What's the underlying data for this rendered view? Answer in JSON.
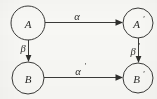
{
  "diagram": {
    "kind": "commutative-square",
    "background_color": "#f7f7f4",
    "stroke_color": "#3a3a38",
    "text_color": "#2b2b29",
    "nodes": [
      {
        "id": "top-left",
        "label": "A",
        "prime": "",
        "cx": 28,
        "cy": 23,
        "r": 17
      },
      {
        "id": "top-right",
        "label": "A",
        "prime": "'",
        "cx": 138,
        "cy": 23,
        "r": 15
      },
      {
        "id": "bottom-left",
        "label": "B",
        "prime": "",
        "cx": 28,
        "cy": 78,
        "r": 16
      },
      {
        "id": "bottom-right",
        "label": "B",
        "prime": "'",
        "cx": 138,
        "cy": 78,
        "r": 15
      }
    ],
    "edges": [
      {
        "id": "top",
        "label": "α",
        "prime": "",
        "from": "top-left",
        "to": "top-right",
        "orientation": "horizontal",
        "label_x": 77,
        "label_y": 16
      },
      {
        "id": "bottom",
        "label": "α",
        "prime": "'",
        "from": "bottom-left",
        "to": "bottom-right",
        "orientation": "horizontal",
        "label_x": 79,
        "label_y": 71
      },
      {
        "id": "left",
        "label": "β",
        "prime": "",
        "from": "top-left",
        "to": "bottom-left",
        "orientation": "vertical",
        "label_x": 23,
        "label_y": 48
      },
      {
        "id": "right",
        "label": "β",
        "prime": "'",
        "from": "top-right",
        "to": "bottom-right",
        "orientation": "vertical",
        "label_x": 133,
        "label_y": 51
      }
    ]
  }
}
